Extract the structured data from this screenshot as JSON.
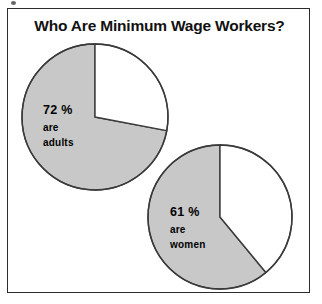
{
  "figure": {
    "title": "Who Are Minimum Wage Workers?",
    "frame_border_color": "#2b2b2b",
    "background_color": "#ffffff"
  },
  "colors": {
    "slice_gray": "#c8c8c8",
    "slice_white": "#ffffff",
    "outline": "#3a3a3a",
    "text": "#000000"
  },
  "pies": [
    {
      "id": "adults",
      "name": "pie-chart-adults",
      "percent_label": "72 %",
      "line1": "are",
      "line2": "adults",
      "center": {
        "x": 80,
        "y": 80
      },
      "radius": 73,
      "highlight_percent": 72,
      "remainder_percent": 28
    },
    {
      "id": "women",
      "name": "pie-chart-women",
      "percent_label": "61 %",
      "line1": "are",
      "line2": "women",
      "center": {
        "x": 80,
        "y": 79
      },
      "radius": 72,
      "highlight_percent": 61,
      "remainder_percent": 39
    }
  ],
  "chart_data": {
    "type": "pie",
    "title": "Who Are Minimum Wage Workers?",
    "xlabel": "",
    "ylabel": "",
    "legend": "none",
    "grid": false,
    "charts": [
      {
        "name": "Are adults",
        "slices": [
          {
            "label": "72 % are adults",
            "value": 72,
            "color": "#c8c8c8"
          },
          {
            "label": "",
            "value": 28,
            "color": "#ffffff"
          }
        ],
        "start_angle_deg": 0,
        "direction": "clockwise"
      },
      {
        "name": "Are women",
        "slices": [
          {
            "label": "61 % are women",
            "value": 61,
            "color": "#c8c8c8"
          },
          {
            "label": "",
            "value": 39,
            "color": "#ffffff"
          }
        ],
        "start_angle_deg": 0,
        "direction": "clockwise"
      }
    ]
  }
}
